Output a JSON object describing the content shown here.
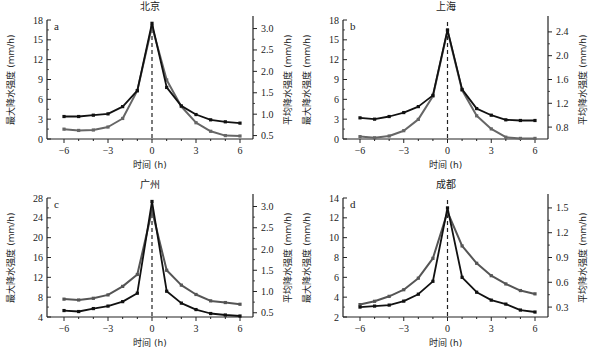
{
  "chart_data": [
    {
      "id": "a",
      "type": "line",
      "title": "北京",
      "panel_letter": "a",
      "xlabel": "时间 (h)",
      "ylabel_left": "最大降水强度 (mm/h)",
      "ylabel_right": "平均降水强度 (mm/h)",
      "x": [
        -6,
        -5,
        -4,
        -3,
        -2,
        -1,
        0,
        1,
        2,
        3,
        4,
        5,
        6
      ],
      "xticks": [
        -6,
        -3,
        0,
        3,
        6
      ],
      "xtick_labels": [
        "−6",
        "−3",
        "0",
        "3",
        "6"
      ],
      "ylim_left": [
        0,
        18
      ],
      "yticks_left": [
        0,
        3,
        6,
        9,
        12,
        15,
        18
      ],
      "ylim_right": [
        0.42,
        3.2
      ],
      "yticks_right": [
        0.5,
        1.0,
        1.5,
        2.0,
        2.5,
        3.0
      ],
      "ytick_labels_right": [
        "0.5",
        "1.0",
        "1.5",
        "2.0",
        "2.5",
        "3.0"
      ],
      "series": [
        {
          "name": "最大降水强度",
          "axis": "left",
          "color": "#111111",
          "values": [
            3.4,
            3.4,
            3.6,
            3.8,
            4.9,
            7.3,
            17.5,
            7.8,
            5.0,
            3.7,
            2.9,
            2.6,
            2.4
          ]
        },
        {
          "name": "平均降水强度",
          "axis": "right",
          "color": "#666666",
          "values": [
            0.65,
            0.62,
            0.63,
            0.7,
            0.9,
            1.55,
            3.05,
            1.8,
            1.18,
            0.8,
            0.6,
            0.5,
            0.49
          ]
        }
      ],
      "vline_x": 0,
      "grid": false
    },
    {
      "id": "b",
      "type": "line",
      "title": "上海",
      "panel_letter": "b",
      "xlabel": "时间 (h)",
      "ylabel_left": "最大降水强度 (mm/h)",
      "ylabel_right": "平均降水强度 (mm/h)",
      "x": [
        -6,
        -5,
        -4,
        -3,
        -2,
        -1,
        0,
        1,
        2,
        3,
        4,
        5,
        6
      ],
      "xticks": [
        -6,
        -3,
        0,
        3,
        6
      ],
      "xtick_labels": [
        "−6",
        "−3",
        "0",
        "3",
        "6"
      ],
      "ylim_left": [
        0,
        18
      ],
      "yticks_left": [
        0,
        3,
        6,
        9,
        12,
        15,
        18
      ],
      "ylim_right": [
        0.6,
        2.6
      ],
      "yticks_right": [
        0.8,
        1.2,
        1.6,
        2.0,
        2.4
      ],
      "ytick_labels_right": [
        "0.8",
        "1.2",
        "1.6",
        "2.0",
        "2.4"
      ],
      "series": [
        {
          "name": "最大降水强度",
          "axis": "left",
          "color": "#111111",
          "values": [
            3.2,
            3.0,
            3.4,
            4.0,
            4.9,
            6.6,
            16.5,
            7.5,
            4.6,
            3.6,
            2.9,
            2.8,
            2.8
          ]
        },
        {
          "name": "平均降水强度",
          "axis": "right",
          "color": "#666666",
          "values": [
            0.64,
            0.62,
            0.65,
            0.74,
            0.93,
            1.32,
            2.42,
            1.42,
            0.99,
            0.77,
            0.63,
            0.61,
            0.61
          ]
        }
      ],
      "vline_x": 0,
      "grid": false
    },
    {
      "id": "c",
      "type": "line",
      "title": "广州",
      "panel_letter": "c",
      "xlabel": "时间 (h)",
      "ylabel_left": "最大降水强度 (mm/h)",
      "ylabel_right": "平均降水强度 (mm/h)",
      "x": [
        -6,
        -5,
        -4,
        -3,
        -2,
        -1,
        0,
        1,
        2,
        3,
        4,
        5,
        6
      ],
      "xticks": [
        -6,
        -3,
        0,
        3,
        6
      ],
      "xtick_labels": [
        "−6",
        "−3",
        "0",
        "3",
        "6"
      ],
      "ylim_left": [
        4,
        28
      ],
      "yticks_left": [
        4,
        8,
        12,
        16,
        20,
        24,
        28
      ],
      "ylim_right": [
        0.4,
        3.2
      ],
      "yticks_right": [
        0.5,
        1.0,
        1.5,
        2.0,
        2.5,
        3.0
      ],
      "ytick_labels_right": [
        "0.5",
        "1.0",
        "1.5",
        "2.0",
        "2.5",
        "3.0"
      ],
      "series": [
        {
          "name": "最大降水强度",
          "axis": "left",
          "color": "#111111",
          "values": [
            5.3,
            5.1,
            5.7,
            6.2,
            7.1,
            8.8,
            27.3,
            9.2,
            6.8,
            5.5,
            4.7,
            4.4,
            4.2
          ]
        },
        {
          "name": "平均降水强度",
          "axis": "right",
          "color": "#555555",
          "values": [
            0.82,
            0.8,
            0.84,
            0.92,
            1.12,
            1.4,
            2.9,
            1.5,
            1.15,
            0.93,
            0.78,
            0.74,
            0.7
          ]
        }
      ],
      "vline_x": 0,
      "grid": false
    },
    {
      "id": "d",
      "type": "line",
      "title": "成都",
      "panel_letter": "d",
      "xlabel": "时间 (h)",
      "ylabel_left": "最大降水强度 (mm/h)",
      "ylabel_right": "平均降水强度 (mm/h)",
      "x": [
        -6,
        -5,
        -4,
        -3,
        -2,
        -1,
        0,
        1,
        2,
        3,
        4,
        5,
        6
      ],
      "xticks": [
        -6,
        -3,
        0,
        3,
        6
      ],
      "xtick_labels": [
        "−6",
        "−3",
        "0",
        "3",
        "6"
      ],
      "ylim_left": [
        2,
        14
      ],
      "yticks_left": [
        2,
        4,
        6,
        8,
        10,
        12,
        14
      ],
      "ylim_right": [
        0.18,
        1.62
      ],
      "yticks_right": [
        0.3,
        0.6,
        0.9,
        1.2,
        1.5
      ],
      "ytick_labels_right": [
        "0.3",
        "0.6",
        "0.9",
        "1.2",
        "1.5"
      ],
      "series": [
        {
          "name": "最大降水强度",
          "axis": "left",
          "color": "#111111",
          "values": [
            3.0,
            3.1,
            3.2,
            3.6,
            4.3,
            5.6,
            13.0,
            6.0,
            4.5,
            3.7,
            3.3,
            2.7,
            2.5
          ]
        },
        {
          "name": "平均降水强度",
          "axis": "right",
          "color": "#555555",
          "values": [
            0.33,
            0.37,
            0.43,
            0.51,
            0.65,
            0.89,
            1.45,
            1.04,
            0.83,
            0.68,
            0.58,
            0.5,
            0.46
          ]
        }
      ],
      "vline_x": 0,
      "grid": false
    }
  ]
}
